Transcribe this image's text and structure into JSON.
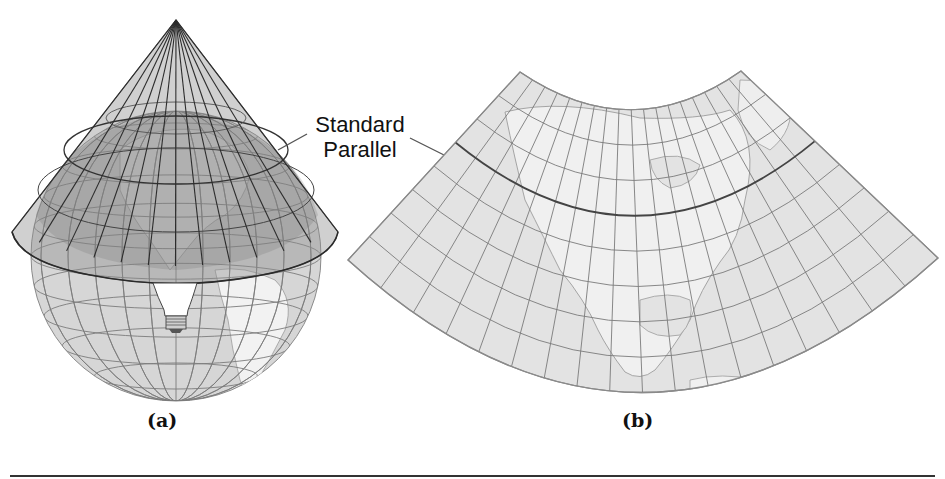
{
  "figure": {
    "callout": {
      "line1": "Standard",
      "line2": "Parallel"
    },
    "panels": [
      {
        "label": "(a)",
        "description": "Cone tangent to globe with light source at center"
      },
      {
        "label": "(b)",
        "description": "Resulting conic projection of North America"
      }
    ]
  },
  "colors": {
    "cone_fill": "#8a8a8a",
    "globe_fill": "#d9d9d9",
    "land_fill": "#efefef",
    "map_fill": "#e2e2e2",
    "grid_line": "#777777",
    "dark_line": "#2a2a2a",
    "rule": "#333333"
  },
  "projection_grid": {
    "meridians": 18,
    "parallels": 7,
    "standard_parallel_index": 2
  }
}
